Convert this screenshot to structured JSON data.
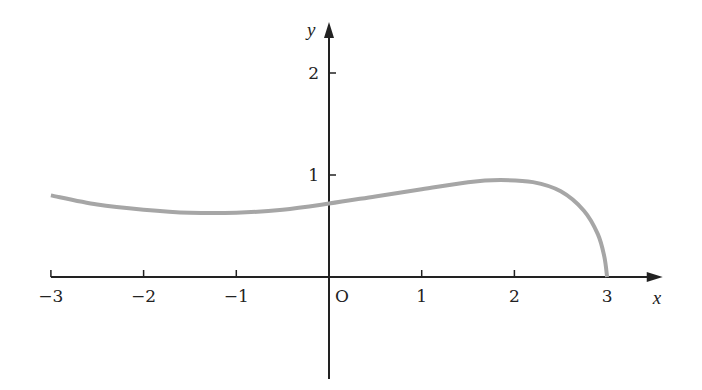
{
  "chart_data": {
    "type": "line",
    "title": "",
    "xlabel": "x",
    "ylabel": "y",
    "origin_label": "O",
    "xlim": [
      -3,
      3.6
    ],
    "ylim": [
      -1.0,
      2.5
    ],
    "x_ticks": [
      -3,
      -2,
      -1,
      1,
      2,
      3
    ],
    "x_tick_labels": [
      "−3",
      "−2",
      "−1",
      "1",
      "2",
      "3"
    ],
    "y_ticks": [
      1,
      2
    ],
    "y_tick_labels": [
      "1",
      "2"
    ],
    "grid": false,
    "legend": null,
    "series": [
      {
        "name": "f(x)",
        "color": "#a6a6a6",
        "x": [
          -3,
          -2.5,
          -2,
          -1.5,
          -1,
          -0.5,
          0,
          0.5,
          1,
          1.5,
          1.85,
          2.2,
          2.5,
          2.75,
          2.9,
          2.97,
          3
        ],
        "y": [
          0.8,
          0.71,
          0.66,
          0.63,
          0.63,
          0.66,
          0.72,
          0.79,
          0.86,
          0.93,
          0.95,
          0.93,
          0.84,
          0.65,
          0.42,
          0.2,
          0.0
        ]
      }
    ]
  },
  "layout": {
    "origin_px": [
      329,
      277
    ],
    "px_per_unit_x": 92.7,
    "px_per_unit_y": 102,
    "axis_color": "#222222"
  }
}
